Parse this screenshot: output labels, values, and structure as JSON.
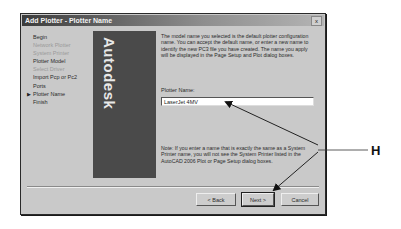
{
  "dialog": {
    "title": "Add Plotter - Plotter Name",
    "close_label": "x"
  },
  "steps": [
    {
      "label": "Begin",
      "state": "normal"
    },
    {
      "label": "Network Plotter",
      "state": "disabled"
    },
    {
      "label": "System Printer",
      "state": "disabled"
    },
    {
      "label": "Plotter Model",
      "state": "normal"
    },
    {
      "label": "Select Driver",
      "state": "disabled"
    },
    {
      "label": "Import Pcp or Pc2",
      "state": "normal"
    },
    {
      "label": "Ports",
      "state": "normal"
    },
    {
      "label": "Plotter Name",
      "state": "current"
    },
    {
      "label": "Finish",
      "state": "normal"
    }
  ],
  "current_step_pointer": "▶",
  "banner": {
    "text": "Autodesk"
  },
  "description": "The model name you selected is the default plotter configuration name. You can accept the default name, or enter a new name to identify the new PC3 file you have created. The name you apply will be displayed in the Page Setup and Plot dialog boxes.",
  "plotter_name": {
    "label": "Plotter Name:",
    "value": "LaserJet 4MV"
  },
  "note": "Note: If you enter a name that is exactly the same as a System Printer name, you will not see the System Printer listed in the AutoCAD 2006 Plot or Page Setup dialog boxes.",
  "buttons": {
    "back": "< Back",
    "next": "Next >",
    "cancel": "Cancel"
  },
  "annotation": {
    "label": "H"
  }
}
